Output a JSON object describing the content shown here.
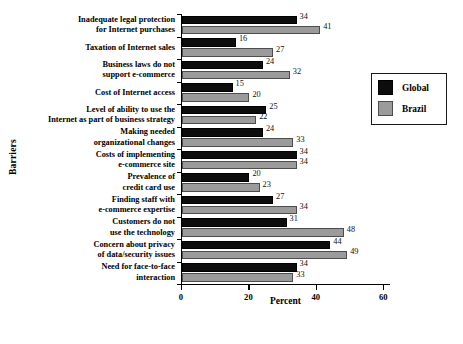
{
  "chart_data": {
    "type": "bar",
    "orientation": "horizontal",
    "title": "",
    "xlabel": "Percent",
    "ylabel": "Barriers",
    "xlim": [
      0,
      62
    ],
    "xticks": [
      0,
      20,
      40,
      60
    ],
    "xtick_labels": [
      "0",
      "20",
      "40",
      "60"
    ],
    "grid": false,
    "legend_position": "top-right",
    "categories": [
      "Inadequate legal protection for Internet purchases",
      "Taxation of Internet sales",
      "Business laws do not support e-commerce",
      "Cost of Internet access",
      "Level of ability to use the Internet as part of business strategy",
      "Making needed organizational changes",
      "Costs of implementing e-commerce site",
      "Prevalence of credit card use",
      "Finding staff with e-commerce expertise",
      "Customers do not use the technology",
      "Concern about privacy of data/security issues",
      "Need for face-to-face interaction"
    ],
    "category_lines": [
      [
        "Inadequate legal protection",
        "for Internet purchases"
      ],
      [
        "Taxation of Internet sales"
      ],
      [
        "Business laws do not",
        "support e-commerce"
      ],
      [
        "Cost of Internet access"
      ],
      [
        "Level of ability to use the",
        "Internet as part of business strategy"
      ],
      [
        "Making needed",
        "organizational changes"
      ],
      [
        "Costs of implementing",
        "e-commerce site"
      ],
      [
        "Prevalence of",
        "credit card use"
      ],
      [
        "Finding staff with",
        "e-commerce expertise"
      ],
      [
        "Customers do not",
        "use the technology"
      ],
      [
        "Concern about privacy",
        "of data/security issues"
      ],
      [
        "Need for face-to-face",
        "interaction"
      ]
    ],
    "series": [
      {
        "name": "Global",
        "color": "#0d0d0d",
        "values": [
          34,
          16,
          24,
          15,
          25,
          24,
          34,
          20,
          27,
          31,
          44,
          34
        ]
      },
      {
        "name": "Brazil",
        "color": "#9b9b9b",
        "values": [
          41,
          27,
          32,
          20,
          22,
          33,
          34,
          23,
          34,
          48,
          49,
          33
        ]
      }
    ]
  },
  "legend": {
    "entries": [
      {
        "label": "Global",
        "swatch": "global"
      },
      {
        "label": "Brazil",
        "swatch": "brazil"
      }
    ]
  }
}
